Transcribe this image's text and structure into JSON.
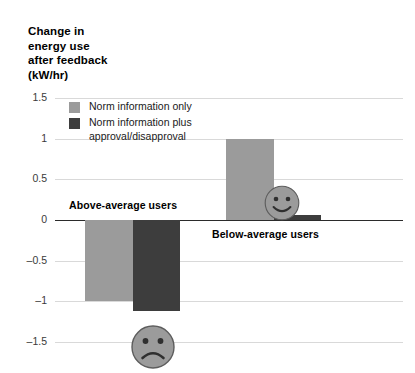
{
  "chart_data": {
    "type": "bar",
    "title": "Change in\nenergy use\nafter feedback\n(kW/hr)",
    "ylabel": "Change in energy use after feedback (kW/hr)",
    "xlabel": "",
    "categories": [
      "Above-average users",
      "Below-average users"
    ],
    "series": [
      {
        "name": "Norm information only",
        "color": "#9b9b9b",
        "values": [
          -1.0,
          1.0
        ]
      },
      {
        "name": "Norm information plus\napproval/disapproval",
        "color": "#3d3d3d",
        "values": [
          -1.12,
          0.06
        ]
      }
    ],
    "ylim": [
      -1.5,
      1.5
    ],
    "yticks": [
      "1.5",
      "1",
      "0.5",
      "0",
      "-0.5",
      "-1",
      "-1.5"
    ],
    "ytick_values": [
      1.5,
      1,
      0.5,
      0,
      -0.5,
      -1,
      -1.5
    ],
    "grid": true,
    "legend_position": "top-left-inside",
    "annotations": [
      {
        "name": "sad-face",
        "emotion": "sad",
        "group": "Above-average users"
      },
      {
        "name": "happy-face",
        "emotion": "happy",
        "group": "Below-average users"
      }
    ]
  },
  "colors": {
    "light_series": "#9b9b9b",
    "dark_series": "#3d3d3d",
    "gridline": "#d9d9d9",
    "zero_line": "#2b2b2b",
    "face_fill": "#9b9b9b",
    "face_stroke": "#4a4a4a"
  },
  "axis": {
    "title": "Change in\nenergy use\nafter feedback\n(kW/hr)",
    "ticks": [
      {
        "label": "1.5",
        "value": 1.5
      },
      {
        "label": "1",
        "value": 1
      },
      {
        "label": "0.5",
        "value": 0.5
      },
      {
        "label": "0",
        "value": 0
      },
      {
        "label": "-0.5",
        "value": -0.5
      },
      {
        "label": "-1",
        "value": -1
      },
      {
        "label": "-1.5",
        "value": -1.5
      }
    ]
  },
  "legend": {
    "items": [
      {
        "label": "Norm information only",
        "swatch": "light"
      },
      {
        "label": "Norm information plus\napproval/disapproval",
        "swatch": "dark"
      }
    ]
  },
  "groups": [
    {
      "label": "Above-average users"
    },
    {
      "label": "Below-average users"
    }
  ]
}
